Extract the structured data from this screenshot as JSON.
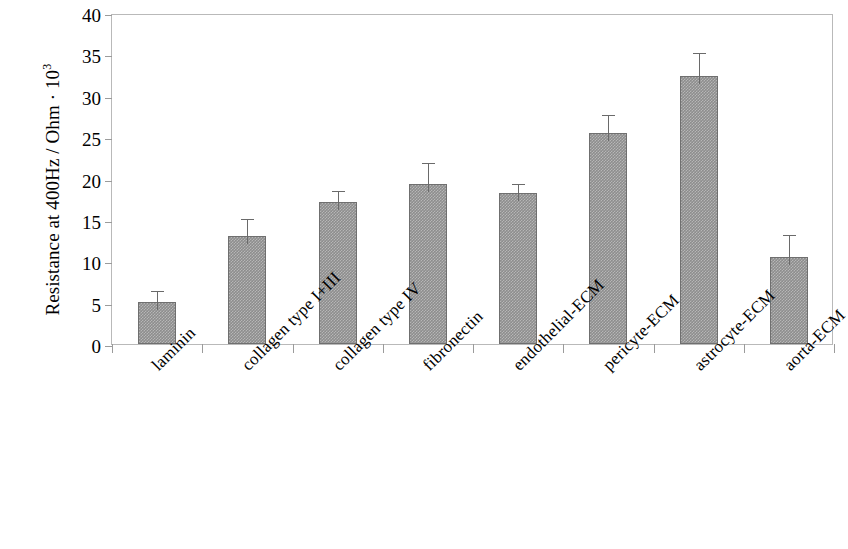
{
  "chart_data": {
    "type": "bar",
    "title": "",
    "xlabel": "",
    "ylabel": "Resistance at 400Hz / Ohm · 10",
    "ylabel_exponent": "3",
    "ylim": [
      0,
      40
    ],
    "yticks": [
      0,
      5,
      10,
      15,
      20,
      25,
      30,
      35,
      40
    ],
    "grid": false,
    "legend": null,
    "categories": [
      "laminin",
      "collagen type I+III",
      "collagen type IV",
      "fibronectin",
      "endothelial-ECM",
      "pericyte-ECM",
      "astrocyte-ECM",
      "aorta-ECM"
    ],
    "values": [
      5.1,
      13.1,
      17.2,
      19.3,
      18.3,
      25.5,
      32.4,
      10.5
    ],
    "errors": [
      1.2,
      1.9,
      1.2,
      2.4,
      0.9,
      2.0,
      2.6,
      2.5
    ],
    "bar_color": "#8d8d8d",
    "bar_edge_color": "#6f6f6f",
    "error_color": "#6a6a6a",
    "axis_color": "#9b9b9b"
  }
}
